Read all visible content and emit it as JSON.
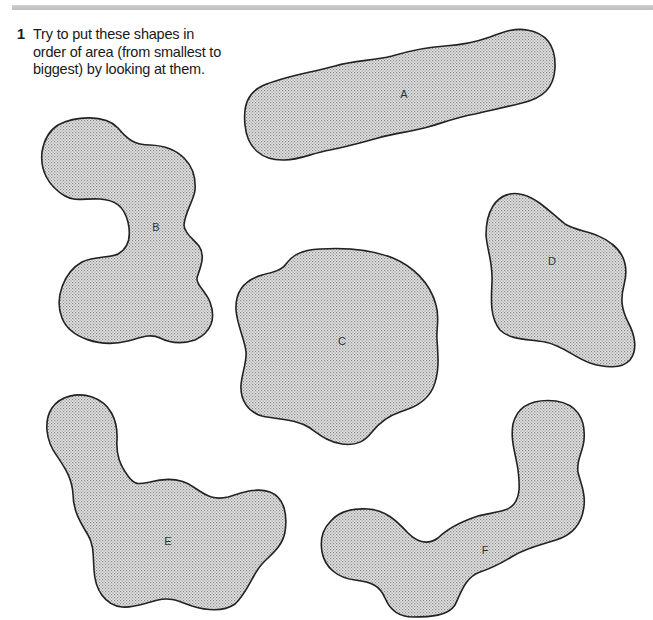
{
  "page": {
    "fill_color": "#d4d4d4",
    "outline_color": "#222222"
  },
  "question": {
    "number": "1",
    "text": "Try to put these shapes in order of area (from smallest to biggest) by looking at them."
  },
  "shapes": [
    {
      "id": "A",
      "label": "A",
      "label_x": 404,
      "label_y": 94
    },
    {
      "id": "B",
      "label": "B",
      "label_x": 156,
      "label_y": 227
    },
    {
      "id": "C",
      "label": "C",
      "label_x": 342,
      "label_y": 341
    },
    {
      "id": "D",
      "label": "D",
      "label_x": 552,
      "label_y": 261
    },
    {
      "id": "E",
      "label": "E",
      "label_x": 168,
      "label_y": 541
    },
    {
      "id": "F",
      "label": "F",
      "label_x": 485,
      "label_y": 550
    }
  ]
}
